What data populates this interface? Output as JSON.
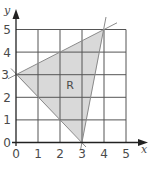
{
  "diagram": {
    "type": "coordinate-plane-feasible-region",
    "x_axis": {
      "label": "x",
      "ticks": [
        "0",
        "1",
        "2",
        "3",
        "4",
        "5"
      ],
      "range": [
        0,
        5
      ]
    },
    "y_axis": {
      "label": "y",
      "ticks": [
        "0",
        "1",
        "2",
        "3",
        "4",
        "5"
      ],
      "range": [
        0,
        5
      ]
    },
    "region": {
      "label": "R",
      "vertices": [
        [
          0,
          3
        ],
        [
          4,
          5
        ],
        [
          3,
          0
        ]
      ],
      "fill": "#d9d9d9"
    },
    "lines": [
      {
        "through": [
          [
            0,
            3
          ],
          [
            4,
            5
          ]
        ]
      },
      {
        "through": [
          [
            0,
            3
          ],
          [
            3,
            0
          ]
        ]
      },
      {
        "through": [
          [
            3,
            0
          ],
          [
            4,
            5
          ]
        ]
      }
    ],
    "colors": {
      "grid": "#555555",
      "boundary": "#8a8a8a",
      "axis": "#222222",
      "text": "#4a4a4a"
    }
  }
}
